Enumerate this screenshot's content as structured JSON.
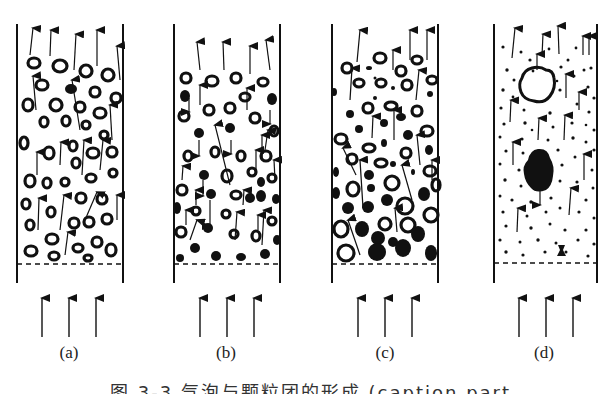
{
  "figure": {
    "panels": [
      {
        "id": "a",
        "label": "(a)",
        "description": "Fluidized column with uniformly dispersed hollow particles rising with upward gas flow"
      },
      {
        "id": "b",
        "label": "(b)",
        "description": "Mixed hollow and solid particles; solid particles falling, hollow ones rising"
      },
      {
        "id": "c",
        "label": "(c)",
        "description": "Larger agglomerated hollow and solid particles accumulating near the bottom"
      },
      {
        "id": "d",
        "label": "(d)",
        "description": "Fine dispersed particles with a large bubble (hollow) and a large solid cluster"
      }
    ],
    "caption": "图 3-3 气泡与颗粒团的形成 (caption partially cropped)"
  },
  "colors": {
    "ink": "#111111",
    "background": "#ffffff"
  }
}
